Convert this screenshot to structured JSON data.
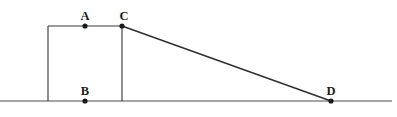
{
  "figure": {
    "canvas": {
      "width": 397,
      "height": 117
    },
    "colors": {
      "background": "#ffffff",
      "stroke": "#3a3a3a",
      "diagonal_stroke": "#2f2f2f",
      "baseline_stroke": "#4a4a4a",
      "dot_fill": "#1a1a1a",
      "label_color": "#1c1c1c"
    },
    "points": [
      {
        "id": "A",
        "label": "A",
        "x": 85,
        "y": 26,
        "label_x": 85,
        "label_y": 22
      },
      {
        "id": "B",
        "label": "B",
        "x": 85,
        "y": 101,
        "label_x": 85,
        "label_y": 97
      },
      {
        "id": "C",
        "label": "C",
        "x": 122,
        "y": 26,
        "label_x": 124,
        "label_y": 22
      },
      {
        "id": "D",
        "label": "D",
        "x": 331,
        "y": 101,
        "label_x": 331,
        "label_y": 97
      }
    ],
    "segments": [
      {
        "id": "ground-line",
        "name": "baseline",
        "x1": 0,
        "y1": 101,
        "x2": 392,
        "y2": 101,
        "style": "baseline"
      },
      {
        "id": "top-edge",
        "name": "top-horizontal-edge",
        "x1": 48,
        "y1": 26,
        "x2": 122,
        "y2": 26,
        "style": "line"
      },
      {
        "id": "left-edge",
        "name": "left-vertical-edge",
        "x1": 48,
        "y1": 26,
        "x2": 48,
        "y2": 101,
        "style": "line"
      },
      {
        "id": "right-edge",
        "name": "right-vertical-edge-through-C",
        "x1": 122,
        "y1": 26,
        "x2": 122,
        "y2": 101,
        "style": "line"
      },
      {
        "id": "diagonal-CD",
        "name": "diagonal-from-C-to-D",
        "x1": 122,
        "y1": 26,
        "x2": 331,
        "y2": 101,
        "style": "diagonal"
      }
    ],
    "dot_radius": 2.6
  }
}
